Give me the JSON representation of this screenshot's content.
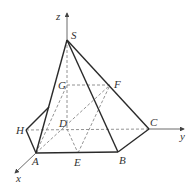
{
  "figure": {
    "type": "3d-pyramid-geometry",
    "axes": {
      "x": {
        "label": "x"
      },
      "y": {
        "label": "y"
      },
      "z": {
        "label": "z"
      }
    },
    "points": {
      "S": {
        "label": "S"
      },
      "A": {
        "label": "A"
      },
      "B": {
        "label": "B"
      },
      "C": {
        "label": "C"
      },
      "D": {
        "label": "D"
      },
      "E": {
        "label": "E"
      },
      "F": {
        "label": "F"
      },
      "G": {
        "label": "G"
      },
      "H": {
        "label": "H"
      }
    },
    "solid_edges": [
      "S-A",
      "S-B",
      "S-C",
      "A-B",
      "B-C",
      "A-H",
      "H-P"
    ],
    "dashed_edges": [
      "H-D",
      "D-C",
      "S-D",
      "G-F",
      "A-G",
      "A-F",
      "D-E",
      "E-F"
    ],
    "colors": {
      "line": "#2a2a2a",
      "dashed": "#777777",
      "background": "#ffffff"
    }
  }
}
